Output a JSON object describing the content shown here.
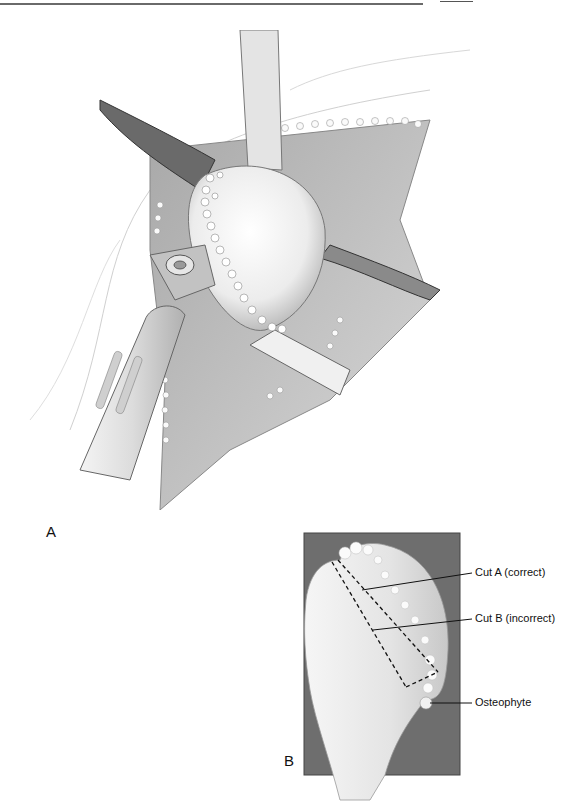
{
  "figure": {
    "panels": [
      {
        "id": "A",
        "label": "A",
        "description": "Surgical exposure of humeral head with osteophytes, retractors and oscillating saw"
      },
      {
        "id": "B",
        "label": "B",
        "description": "Proximal humerus showing correct and incorrect osteotomy cuts"
      }
    ],
    "callouts": [
      {
        "text": "Cut A (correct)"
      },
      {
        "text": "Cut B (incorrect)"
      },
      {
        "text": "Osteophyte"
      }
    ],
    "colors": {
      "background": "#ffffff",
      "panel_b_box": "#6e6e6e",
      "bone": "#f2f2f2",
      "line": "#111111"
    }
  }
}
